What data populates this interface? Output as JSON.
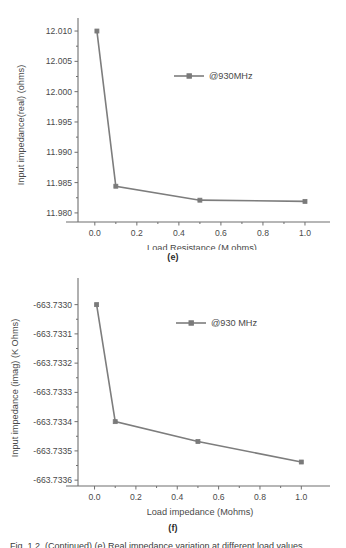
{
  "page": {
    "background": "#ffffff",
    "figure_count": 2
  },
  "bottom_caption": {
    "text": "Fig. 1.2. (Continued) (e) Real impedance variation at different load values"
  },
  "figure_e": {
    "panel_label": "(e)",
    "legend_label": "@930MHz",
    "colors": {
      "line": "#7d7d7d",
      "marker": "#7a7a7a",
      "axis": "#6f6f6f",
      "text": "#4a4a4a"
    },
    "chart_data": {
      "type": "line",
      "title": "",
      "subtitle": "",
      "xlabel": "Load Resistance (M ohms)",
      "ylabel": "Input impedance(real) (ohms)",
      "xlim": [
        -0.08,
        1.1
      ],
      "ylim": [
        11.9785,
        12.0105
      ],
      "xticks": [
        0.0,
        0.2,
        0.4,
        0.6,
        0.8,
        1.0
      ],
      "xtick_labels": [
        "0.0",
        "0.2",
        "0.4",
        "0.6",
        "0.8",
        "1.0"
      ],
      "yticks": [
        11.98,
        11.985,
        11.99,
        11.995,
        12.0,
        12.005,
        12.01
      ],
      "ytick_labels": [
        "11.980",
        "11.985",
        "11.990",
        "11.995",
        "12.000",
        "12.005",
        "12.010"
      ],
      "grid": false,
      "legend_position": "upper-center",
      "series": [
        {
          "name": "@930MHz",
          "x": [
            0.01,
            0.1,
            0.5,
            1.0
          ],
          "values": [
            12.01,
            11.9844,
            11.9821,
            11.9819
          ]
        }
      ]
    }
  },
  "figure_f": {
    "panel_label": "(f)",
    "legend_label": "@930 MHz",
    "colors": {
      "line": "#7d7d7d",
      "marker": "#7a7a7a",
      "axis": "#6f6f6f",
      "text": "#4a4a4a"
    },
    "chart_data": {
      "type": "line",
      "title": "",
      "subtitle": "",
      "xlabel": "Load impedance (Mohms)",
      "ylabel": "Input impedance (imag) (K Ohms)",
      "xlim": [
        -0.08,
        1.1
      ],
      "ylim": [
        -663.73362,
        -663.73295
      ],
      "xticks": [
        0.0,
        0.2,
        0.4,
        0.6,
        0.8,
        1.0
      ],
      "xtick_labels": [
        "0.0",
        "0.2",
        "0.4",
        "0.6",
        "0.8",
        "1.0"
      ],
      "yticks": [
        -663.7336,
        -663.7335,
        -663.7334,
        -663.7333,
        -663.7332,
        -663.7331,
        -663.733
      ],
      "ytick_labels": [
        "-663.7336",
        "-663.7335",
        "-663.7334",
        "-663.7333",
        "-663.7332",
        "-663.7331",
        "-663.7330"
      ],
      "grid": false,
      "legend_position": "upper-center",
      "series": [
        {
          "name": "@930 MHz",
          "x": [
            0.01,
            0.1,
            0.5,
            1.0
          ],
          "values": [
            -663.733,
            -663.7334,
            -663.733468,
            -663.733538
          ]
        }
      ]
    }
  }
}
